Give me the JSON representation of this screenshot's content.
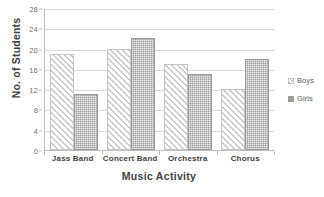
{
  "chart_data": {
    "type": "bar",
    "title": "",
    "subtitle": "",
    "xlabel": "Music Activity",
    "ylabel": "No. of Students",
    "categories": [
      "Jass Band",
      "Concert Band",
      "Orchestra",
      "Chorus"
    ],
    "series": [
      {
        "name": "Boys",
        "values": [
          19,
          20,
          17,
          12
        ],
        "color": "#ffffff",
        "pattern": "diagonal-hatch"
      },
      {
        "name": "Girls",
        "values": [
          11,
          22,
          15,
          18
        ],
        "color": "#9f9f9f",
        "pattern": "solid-dotted"
      }
    ],
    "ylim": [
      0,
      28
    ],
    "ytick_step": 4,
    "yticks": [
      28,
      24,
      20,
      16,
      12,
      8,
      4,
      0
    ],
    "grid": true,
    "grid_axis": "y",
    "legend": true,
    "legend_position": "right",
    "annotations": []
  },
  "legend": {
    "entries": [
      {
        "label": "Boys"
      },
      {
        "label": "Girls"
      }
    ]
  },
  "axes": {
    "y_title": "No. of Students",
    "x_title": "Music Activity"
  }
}
